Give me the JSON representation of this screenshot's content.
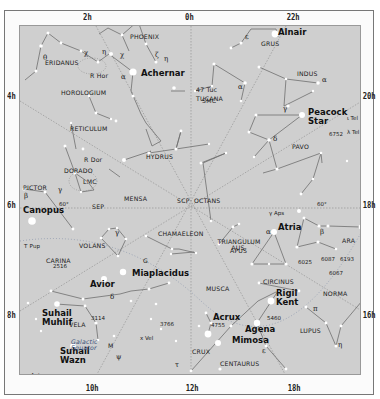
{
  "map": {
    "title": "Southern circumpolar star chart",
    "ra_labels_top": [
      "2h",
      "0h",
      "22h"
    ],
    "ra_labels_bottom": [
      "10h",
      "12h",
      "18h"
    ],
    "dec_labels_left": [
      "4h",
      "6h",
      "8h"
    ],
    "dec_labels_right": [
      "20h",
      "18h",
      "16h"
    ],
    "colors": {
      "field": "#cfcfcf",
      "frame": "#fbfbfb",
      "lines": "#6e6e6e",
      "grid": "#8a8a8a",
      "stars": "#ffffff",
      "text": "#1a1a1a"
    }
  },
  "constellations": [
    "PHOENIX",
    "GRUS",
    "ERIDANUS",
    "INDUS",
    "HOROLOGIUM",
    "TUCANA",
    "RETICULUM",
    "HYDRUS",
    "PAVO",
    "DORADO",
    "PICTOR",
    "MENSA",
    "OCTANS",
    "CHAMAELEON",
    "CARINA",
    "VOLANS",
    "APUS",
    "TRIANGULUM AUS.",
    "ARA",
    "MUSCA",
    "CIRCINUS",
    "NORMA",
    "VELA",
    "LUPUS",
    "CRUX",
    "CENTAURUS"
  ],
  "named_stars": [
    "Alnair",
    "Achernar",
    "Peacock Star",
    "Canopus",
    "Miaplacidus",
    "Atria",
    "Avior",
    "Suhail Muhlif",
    "Suhail Wazn",
    "Acrux",
    "Rigil Kent",
    "Agena",
    "Mimosa"
  ],
  "objects": [
    "R Hor",
    "47 Tuc",
    "SMC",
    "LMC",
    "R Dor",
    "SEP",
    "SCP",
    "T Pup",
    "G",
    "Galactic Equator",
    "6752",
    "6025",
    "6087",
    "6193",
    "6067",
    "2516",
    "3114",
    "3766",
    "4755",
    "5460",
    "γ Aps",
    "λ Tel",
    "ι Tel",
    "ε Ant",
    "x Vel",
    "M"
  ],
  "markers": {
    "dec_60": "60°"
  }
}
